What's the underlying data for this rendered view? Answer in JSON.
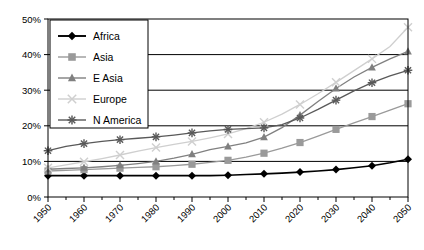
{
  "chart_data": {
    "type": "line",
    "title": "",
    "subtitle": "",
    "xlabel": "",
    "ylabel": "",
    "xlim": [
      1950,
      2050
    ],
    "ylim": [
      0,
      50
    ],
    "yunit": "%",
    "grid": "horizontal",
    "legend_position": "top-left",
    "x": [
      1950,
      1955,
      1960,
      1965,
      1970,
      1975,
      1980,
      1985,
      1990,
      1995,
      2000,
      2005,
      2010,
      2015,
      2020,
      2025,
      2030,
      2035,
      2040,
      2045,
      2050
    ],
    "xticks": [
      "1950",
      "1960",
      "1970",
      "1980",
      "1990",
      "2000",
      "2010",
      "2020",
      "2030",
      "2040",
      "2050"
    ],
    "yticks": [
      "0%",
      "10%",
      "20%",
      "30%",
      "40%",
      "50%"
    ],
    "series": [
      {
        "name": "Africa",
        "marker": "diamond",
        "color": "#000000",
        "values": [
          6.0,
          6.0,
          6.0,
          6.0,
          6.0,
          6.0,
          6.0,
          6.0,
          6.0,
          6.0,
          6.1,
          6.3,
          6.5,
          6.7,
          7.0,
          7.3,
          7.7,
          8.2,
          8.8,
          9.6,
          10.6
        ]
      },
      {
        "name": "Asia",
        "marker": "square",
        "color": "#9a9a9a",
        "values": [
          7.3,
          7.5,
          7.7,
          7.9,
          8.1,
          8.3,
          8.5,
          8.8,
          9.2,
          9.7,
          10.3,
          11.2,
          12.3,
          13.7,
          15.3,
          17.1,
          19.0,
          20.8,
          22.6,
          24.4,
          26.2
        ]
      },
      {
        "name": "E Asia",
        "marker": "triangle",
        "color": "#808080",
        "values": [
          7.8,
          8.0,
          8.2,
          8.5,
          8.9,
          9.4,
          10.0,
          10.9,
          12.0,
          13.3,
          14.2,
          15.2,
          16.8,
          19.5,
          23.0,
          26.8,
          30.5,
          33.7,
          36.4,
          38.8,
          40.9
        ]
      },
      {
        "name": "Europe",
        "marker": "x",
        "color": "#cfcfcf",
        "values": [
          8.2,
          9.0,
          9.9,
          10.8,
          11.8,
          12.9,
          13.9,
          14.8,
          15.6,
          16.6,
          17.7,
          19.2,
          21.0,
          23.3,
          26.0,
          29.0,
          32.2,
          35.5,
          38.8,
          42.3,
          47.7
        ]
      },
      {
        "name": "N America",
        "marker": "asterisk",
        "color": "#595959",
        "values": [
          13.0,
          14.2,
          15.0,
          15.6,
          16.1,
          16.5,
          16.9,
          17.4,
          18.0,
          18.6,
          19.0,
          19.2,
          19.4,
          20.3,
          22.2,
          24.6,
          27.2,
          29.8,
          32.1,
          34.0,
          35.6
        ]
      }
    ]
  },
  "legend": {
    "items": [
      {
        "label": "Africa"
      },
      {
        "label": "Asia"
      },
      {
        "label": "E Asia"
      },
      {
        "label": "Europe"
      },
      {
        "label": "N America"
      }
    ]
  }
}
